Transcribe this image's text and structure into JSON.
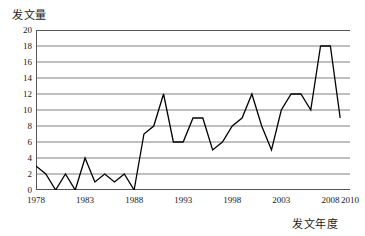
{
  "chart_data": {
    "type": "line",
    "title": "",
    "xlabel": "发文年度",
    "ylabel": "发文量",
    "xlim": [
      1978,
      2010
    ],
    "ylim": [
      0,
      20
    ],
    "ytick_step": 2,
    "xtick_step": 1,
    "grid": true,
    "legend": null,
    "line_color": "#000000",
    "grid_color": "#808080",
    "frame_color": "#555555",
    "yticks": [
      0,
      2,
      4,
      6,
      8,
      10,
      12,
      14,
      16,
      18,
      20
    ],
    "xtick_labels": [
      "1978",
      "1983",
      "1988",
      "1993",
      "1998",
      "2003",
      "2008",
      "2010"
    ],
    "xtick_label_years": [
      1978,
      1983,
      1988,
      1993,
      1998,
      2003,
      2008,
      2010
    ],
    "x": [
      1978,
      1979,
      1980,
      1981,
      1982,
      1983,
      1984,
      1985,
      1986,
      1987,
      1988,
      1989,
      1990,
      1991,
      1992,
      1993,
      1994,
      1995,
      1996,
      1997,
      1998,
      1999,
      2000,
      2001,
      2002,
      2003,
      2004,
      2005,
      2006,
      2007,
      2008,
      2009
    ],
    "values": [
      3,
      2,
      0,
      2,
      0,
      4,
      1,
      2,
      1,
      2,
      0,
      7,
      8,
      12,
      6,
      6,
      9,
      9,
      5,
      6,
      8,
      9,
      12,
      8,
      5,
      10,
      12,
      12,
      10,
      18,
      18,
      9
    ],
    "series": [
      {
        "name": "发文量",
        "values": [
          3,
          2,
          0,
          2,
          0,
          4,
          1,
          2,
          1,
          2,
          0,
          7,
          8,
          12,
          6,
          6,
          9,
          9,
          5,
          6,
          8,
          9,
          12,
          8,
          5,
          10,
          12,
          12,
          10,
          18,
          18,
          9
        ]
      }
    ]
  }
}
